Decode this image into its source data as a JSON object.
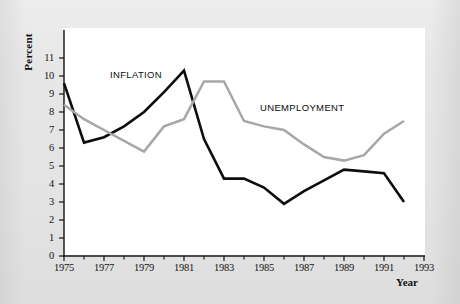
{
  "chart_data": {
    "type": "line",
    "title": "",
    "xlabel": "Year",
    "ylabel": "Percent",
    "xlim": [
      1975,
      1993
    ],
    "ylim": [
      0,
      11
    ],
    "grid": false,
    "legend_position": "inline-annotations",
    "x_ticks": [
      "1975",
      "1977",
      "1979",
      "1981",
      "1983",
      "1985",
      "1987",
      "1989",
      "1991",
      "1993"
    ],
    "x_tick_values": [
      1975,
      1977,
      1979,
      1981,
      1983,
      1985,
      1987,
      1989,
      1991,
      1993
    ],
    "x_minor_tick_values": [
      1976,
      1978,
      1980,
      1982,
      1984,
      1986,
      1988,
      1990,
      1992
    ],
    "y_ticks": [
      "0",
      "1",
      "2",
      "3",
      "4",
      "5",
      "6",
      "7",
      "8",
      "9",
      "10",
      "11"
    ],
    "y_tick_values": [
      0,
      1,
      2,
      3,
      4,
      5,
      6,
      7,
      8,
      9,
      10,
      11
    ],
    "x": [
      1975,
      1976,
      1977,
      1978,
      1979,
      1980,
      1981,
      1982,
      1983,
      1984,
      1985,
      1986,
      1987,
      1988,
      1989,
      1990,
      1991,
      1992
    ],
    "series": [
      {
        "name": "INFLATION",
        "color": "#0d0d0d",
        "label_x": 1977.3,
        "label_y": 10.05,
        "values": [
          9.6,
          6.3,
          6.6,
          7.2,
          8.0,
          9.1,
          10.3,
          6.5,
          4.3,
          4.3,
          3.8,
          2.9,
          3.6,
          4.2,
          4.8,
          4.7,
          4.6,
          3.0
        ]
      },
      {
        "name": "UNEMPLOYMENT",
        "color": "#a7a7a7",
        "label_x": 1984.8,
        "label_y": 8.25,
        "values": [
          8.4,
          7.6,
          7.0,
          6.4,
          5.8,
          7.2,
          7.6,
          9.7,
          9.7,
          7.5,
          7.2,
          7.0,
          6.2,
          5.5,
          5.3,
          5.6,
          6.8,
          7.5
        ]
      }
    ]
  },
  "axis": {
    "y_title": "Percent",
    "x_title": "Year"
  }
}
